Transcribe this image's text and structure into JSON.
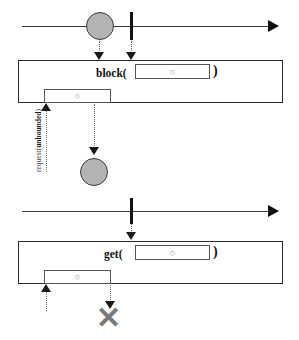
{
  "figure": {
    "title": "",
    "glyph_symbol": "○",
    "colors": {
      "marble_fill": "#b3b3b3",
      "marble_stroke": "#3b3b3b",
      "timeline": "#3a3a3a",
      "frame": "#2b2b2b",
      "dotted": "#6b6b6b",
      "x_mark": "#7a7a7a",
      "background": "#ffffff"
    },
    "panels": [
      {
        "id": "block-panel",
        "operation_label": "block(",
        "operation_close": ")",
        "timeline": {
          "marbles": [
            {
              "id": "emitted-item",
              "symbol": "○",
              "x": 100,
              "y": 26
            }
          ],
          "completion_bar": true,
          "arrow_head": true
        },
        "subscriber_box": {
          "label": "",
          "inner_item_symbol": "○"
        },
        "request_label_prefix": "request(",
        "request_label_bold": "unbounded",
        "request_label_suffix": ")",
        "result_marble": {
          "symbol": "○"
        },
        "terminal": "marble"
      },
      {
        "id": "get-panel",
        "operation_label": "get(",
        "operation_close": ")",
        "timeline": {
          "marbles": [],
          "completion_bar": true,
          "arrow_head": true
        },
        "subscriber_box": {
          "label": "",
          "inner_item_symbol": "○"
        },
        "request_label_prefix": "",
        "request_label_bold": "",
        "request_label_suffix": "",
        "result_marble": null,
        "terminal": "x",
        "x_symbol": "✕"
      }
    ]
  }
}
